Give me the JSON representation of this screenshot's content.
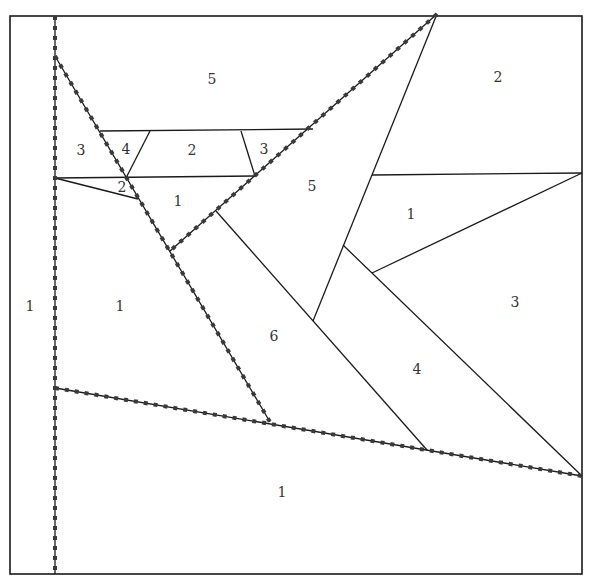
{
  "diagram": {
    "type": "paper-piecing-pattern",
    "stroke_color": "#1a1a1a",
    "seam_color": "#3a3a3a",
    "border": {
      "x1": 10,
      "y1": 16,
      "x2": 582,
      "y2": 574
    },
    "seam_lines": [
      {
        "id": "vertical-seam",
        "points": [
          [
            55,
            16
          ],
          [
            55,
            574
          ]
        ]
      },
      {
        "id": "diagonal-left-seam",
        "points": [
          [
            55,
            56
          ],
          [
            270,
            422
          ]
        ]
      },
      {
        "id": "diagonal-upper-seam",
        "points": [
          [
            437,
            14
          ],
          [
            170,
            251
          ]
        ]
      },
      {
        "id": "horizontal-lower-seam",
        "points": [
          [
            55,
            388
          ],
          [
            582,
            476
          ]
        ]
      }
    ],
    "plain_lines": [
      [
        [
          437,
          14
        ],
        [
          313,
          321
        ]
      ],
      [
        [
          372,
          175
        ],
        [
          582,
          173
        ]
      ],
      [
        [
          582,
          173
        ],
        [
          372,
          273
        ]
      ],
      [
        [
          343,
          245
        ],
        [
          582,
          476
        ]
      ],
      [
        [
          216,
          211
        ],
        [
          427,
          450
        ]
      ],
      [
        [
          100,
          131
        ],
        [
          313,
          129
        ]
      ],
      [
        [
          55,
          178
        ],
        [
          255,
          176
        ]
      ],
      [
        [
          150,
          131
        ],
        [
          126,
          178
        ]
      ],
      [
        [
          241,
          131
        ],
        [
          255,
          176
        ]
      ],
      [
        [
          55,
          178
        ],
        [
          138,
          199
        ]
      ]
    ],
    "labels": [
      {
        "text": "1",
        "x": 30,
        "y": 307
      },
      {
        "text": "5",
        "x": 212,
        "y": 80
      },
      {
        "text": "2",
        "x": 498,
        "y": 78
      },
      {
        "text": "3",
        "x": 81,
        "y": 151
      },
      {
        "text": "4",
        "x": 126,
        "y": 150
      },
      {
        "text": "2",
        "x": 192,
        "y": 151
      },
      {
        "text": "3",
        "x": 264,
        "y": 150
      },
      {
        "text": "2",
        "x": 122,
        "y": 188
      },
      {
        "text": "1",
        "x": 178,
        "y": 202
      },
      {
        "text": "5",
        "x": 312,
        "y": 187
      },
      {
        "text": "1",
        "x": 411,
        "y": 215
      },
      {
        "text": "1",
        "x": 120,
        "y": 307
      },
      {
        "text": "3",
        "x": 515,
        "y": 303
      },
      {
        "text": "6",
        "x": 274,
        "y": 337
      },
      {
        "text": "4",
        "x": 417,
        "y": 370
      },
      {
        "text": "1",
        "x": 282,
        "y": 493
      }
    ]
  }
}
